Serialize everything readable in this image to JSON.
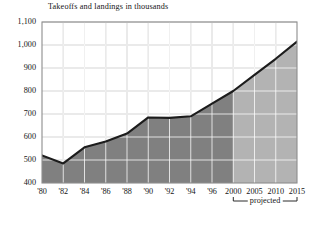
{
  "chart_data": {
    "type": "area",
    "title": "Takeoffs and landings in thousands",
    "xlabel": "",
    "ylabel": "",
    "ylim": [
      400,
      1100
    ],
    "ytick_step": 100,
    "yticks": [
      "400",
      "500",
      "600",
      "700",
      "800",
      "900",
      "1,000",
      "1,100"
    ],
    "ytick_values": [
      400,
      500,
      600,
      700,
      800,
      900,
      1000,
      1100
    ],
    "categories": [
      "'80",
      "'82",
      "'84",
      "'86",
      "'88",
      "'90",
      "'92",
      "'94",
      "'96",
      "2000",
      "2005",
      "2010",
      "2015"
    ],
    "values": [
      520,
      485,
      555,
      580,
      615,
      685,
      683,
      690,
      745,
      800,
      870,
      940,
      1015
    ],
    "grid": true,
    "legend": "none",
    "annotations": [
      {
        "name": "projected-bracket",
        "label": "projected",
        "from_category": "2000",
        "to_category": "2015"
      }
    ],
    "series_colors": {
      "line": "#1c1c1c",
      "fill_actual": "#808080",
      "fill_projected": "#b3b3b3"
    },
    "split_category": "2000"
  },
  "axes": {
    "frame_color": "#8d8d8d",
    "grid_color": "#b8b8b8"
  },
  "icons": {}
}
